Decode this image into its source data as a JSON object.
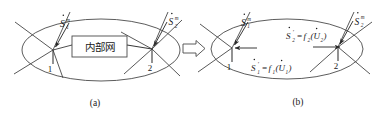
{
  "figure": {
    "background_color": "#ffffff",
    "line_color": "#3a3a3a",
    "text_color": "#1a1a1a",
    "panels": [
      {
        "id": "a",
        "caption": "(a)",
        "boundary_shape": "ellipse",
        "inner_box_text": "内部网",
        "nodes": [
          {
            "id": "node-1",
            "number": "1"
          },
          {
            "id": "node-2",
            "number": "2"
          }
        ],
        "labels": [
          {
            "id": "label-s1m",
            "base": "S",
            "subscript": "1",
            "superscript": "m",
            "has_dot": true,
            "text": "Ṡ₁ᵐ"
          },
          {
            "id": "label-s2m",
            "base": "S",
            "subscript": "2",
            "superscript": "m",
            "has_dot": true,
            "text": "Ṡ₂ᵐ"
          }
        ]
      },
      {
        "id": "b",
        "caption": "(b)",
        "boundary_shape": "ellipse",
        "inner_box_text": "",
        "nodes": [
          {
            "id": "node-1",
            "number": "1"
          },
          {
            "id": "node-2",
            "number": "2"
          }
        ],
        "labels": [
          {
            "id": "label-s1m",
            "base": "S",
            "subscript": "1",
            "superscript": "m",
            "has_dot": true,
            "text": "Ṡ₁ᵐ"
          },
          {
            "id": "label-s2m",
            "base": "S",
            "subscript": "2",
            "superscript": "m",
            "has_dot": true,
            "text": "Ṡ₂ᵐ"
          }
        ],
        "equations": [
          {
            "id": "equation-s1",
            "lhs_base": "S",
            "lhs_sub": "1",
            "lhs_prime": "′",
            "relation": "=",
            "func": "f",
            "func_sub": "1",
            "arg_open": "(",
            "arg_base": "U",
            "arg_sub": "1",
            "arg_close": ")",
            "text": "Ṡ₁′ = f₁(U̇₁)"
          },
          {
            "id": "equation-s2",
            "lhs_base": "S",
            "lhs_sub": "2",
            "lhs_prime": "′",
            "relation": "=",
            "func": "f",
            "func_sub": "2",
            "arg_open": "(",
            "arg_base": "U",
            "arg_sub": "2",
            "arg_close": ")",
            "text": "Ṡ₂′ = f₂(U̇₂)"
          }
        ]
      }
    ],
    "transform_arrow": {
      "id": "transform-arrow",
      "direction": "right",
      "style": "hollow-block-arrow"
    }
  }
}
